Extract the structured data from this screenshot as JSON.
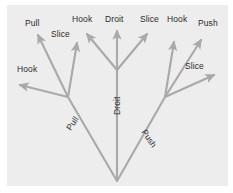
{
  "figure": {
    "panel_background": "#ededed",
    "page_background": "#ffffff",
    "stroke_color": "#a9a9a9",
    "label_color": "#2b2b2b"
  },
  "labels": {
    "top_pull": "Pull",
    "top_slice_left": "Slice",
    "top_hook_center_left": "Hook",
    "top_droit": "Droit",
    "top_slice_center_right": "Slice",
    "top_hook_right": "Hook",
    "top_push": "Push",
    "left_hook": "Hook",
    "right_slice": "Slice",
    "mid_pull": "Pull",
    "mid_droit": "Droit",
    "mid_push": "Push"
  },
  "tree": {
    "root": {
      "name": "root",
      "x": 110,
      "y": 176
    },
    "branches": [
      {
        "name": "pull-branch",
        "label": "Pull",
        "junction": {
          "x": 61,
          "y": 92
        },
        "leaves": [
          {
            "name": "hook-left",
            "label": "Hook",
            "tip_x": 10,
            "tip_y": 79
          },
          {
            "name": "pull-upleft",
            "label": "Pull",
            "tip_x": 29,
            "tip_y": 27
          },
          {
            "name": "slice-up",
            "label": "Slice",
            "tip_x": 71,
            "tip_y": 35
          }
        ]
      },
      {
        "name": "droit-branch",
        "label": "Droit",
        "junction": {
          "x": 110,
          "y": 65
        },
        "leaves": [
          {
            "name": "hook-center-left",
            "label": "Hook",
            "tip_x": 78,
            "tip_y": 26
          },
          {
            "name": "droit-up",
            "label": "Droit",
            "tip_x": 110,
            "tip_y": 23
          },
          {
            "name": "slice-center-right",
            "label": "Slice",
            "tip_x": 142,
            "tip_y": 26
          }
        ]
      },
      {
        "name": "push-branch",
        "label": "Push",
        "junction": {
          "x": 158,
          "y": 92
        },
        "leaves": [
          {
            "name": "hook-right",
            "label": "Hook",
            "tip_x": 168,
            "tip_y": 33
          },
          {
            "name": "push-upright",
            "label": "Push",
            "tip_x": 196,
            "tip_y": 31
          },
          {
            "name": "slice-right",
            "label": "Slice",
            "tip_x": 210,
            "tip_y": 69
          }
        ]
      }
    ]
  }
}
